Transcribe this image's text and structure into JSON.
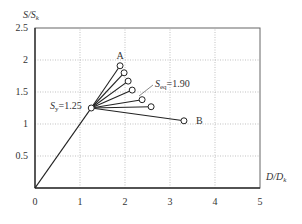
{
  "chart_data": {
    "type": "line",
    "title": "",
    "xlabel": "D/Dk",
    "ylabel": "S/Sk",
    "xlim": [
      0,
      5
    ],
    "ylim": [
      0,
      2.5
    ],
    "grid": true,
    "xticks": [
      "0",
      "1",
      "2",
      "3",
      "4",
      "5"
    ],
    "yticks": [
      "0.5",
      "1",
      "1.5",
      "2",
      "2.5"
    ],
    "series": [
      {
        "name": "elastic",
        "x": [
          0,
          1.25
        ],
        "y": [
          0,
          1.25
        ]
      },
      {
        "name": "fan",
        "origin": [
          1.25,
          1.25
        ],
        "endpoints": [
          {
            "x": 1.89,
            "y": 1.91,
            "label": "A"
          },
          {
            "x": 1.98,
            "y": 1.8
          },
          {
            "x": 2.07,
            "y": 1.67
          },
          {
            "x": 2.16,
            "y": 1.53
          },
          {
            "x": 2.38,
            "y": 1.38
          },
          {
            "x": 2.58,
            "y": 1.27
          },
          {
            "x": 3.31,
            "y": 1.05,
            "label": "B"
          }
        ]
      }
    ],
    "annotations": [
      {
        "text": "Sy=1.25",
        "main": "S",
        "sub": "y",
        "rest": "=1.25",
        "x": 1.25,
        "y": 1.25
      },
      {
        "text": "Seq=1.90",
        "main": "S",
        "sub": "eq",
        "rest": "=1.90"
      },
      {
        "text": "A"
      },
      {
        "text": "B"
      }
    ]
  },
  "axis": {
    "y_main": "S/S",
    "y_sub": "k",
    "x_main": "D/D",
    "x_sub": "k"
  }
}
